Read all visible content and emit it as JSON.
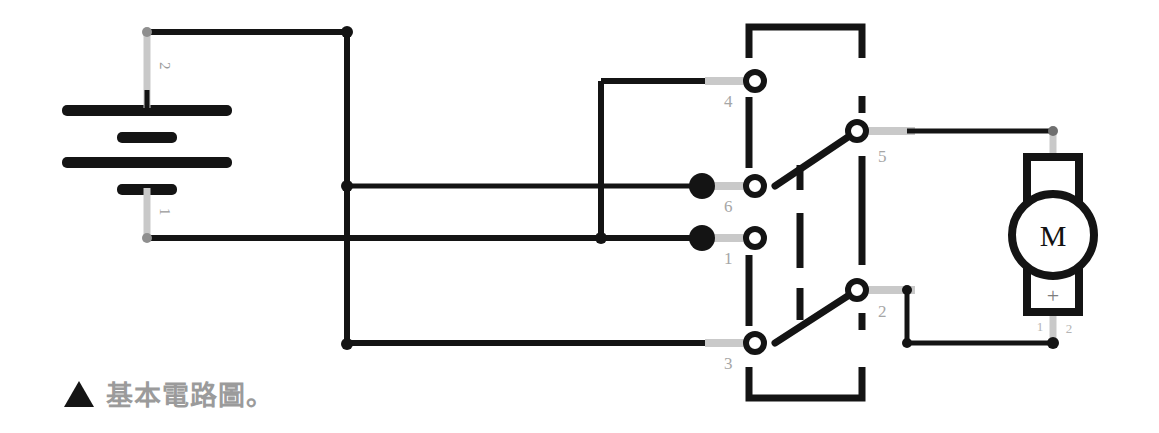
{
  "figure": {
    "caption_marker": "▲",
    "caption_text": "基本電路圖。",
    "type": "circuit-diagram"
  },
  "colors": {
    "wire": "#141414",
    "lead": "#c9c9c9",
    "label": "#a6a6a6",
    "caption": "#9b9b9b",
    "background": "#ffffff"
  },
  "battery": {
    "name": "battery",
    "terminal_labels": {
      "top": "2",
      "bottom": "1"
    },
    "plates": [
      {
        "type": "long",
        "y": 111
      },
      {
        "type": "short",
        "y": 137
      },
      {
        "type": "long",
        "y": 163
      },
      {
        "type": "short",
        "y": 189
      }
    ]
  },
  "switch": {
    "name": "dpdt-switch",
    "terminals": [
      {
        "id": "4",
        "label": "4",
        "x": 755,
        "y": 81,
        "side": "left",
        "filled": false
      },
      {
        "id": "6",
        "label": "6",
        "x": 755,
        "y": 186,
        "side": "left",
        "filled": true
      },
      {
        "id": "1",
        "label": "1",
        "x": 755,
        "y": 238,
        "side": "left",
        "filled": true
      },
      {
        "id": "3",
        "label": "3",
        "x": 755,
        "y": 343,
        "side": "left",
        "filled": false
      },
      {
        "id": "5",
        "label": "5",
        "x": 857,
        "y": 131,
        "side": "right",
        "filled": false
      },
      {
        "id": "2",
        "label": "2",
        "x": 857,
        "y": 290,
        "side": "right",
        "filled": false
      }
    ],
    "poles": [
      {
        "from": "6",
        "to": "5",
        "state": "closed-upper"
      },
      {
        "from": "3",
        "to": "2",
        "state": "closed-lower"
      }
    ]
  },
  "motor": {
    "name": "dc-motor",
    "letter": "M",
    "polarity_marker": "+",
    "pin_labels": {
      "left": "1",
      "right": "2"
    }
  },
  "junctions": [
    {
      "x": 347,
      "y": 32
    },
    {
      "x": 347,
      "y": 186
    },
    {
      "x": 347,
      "y": 344
    },
    {
      "x": 601,
      "y": 238
    },
    {
      "x": 1053,
      "y": 131
    },
    {
      "x": 907,
      "y": 290
    },
    {
      "x": 907,
      "y": 343
    },
    {
      "x": 1053,
      "y": 343
    }
  ]
}
